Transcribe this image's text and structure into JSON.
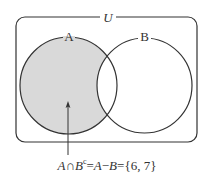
{
  "diagram": {
    "type": "venn",
    "universe": {
      "label": "U"
    },
    "sets": [
      {
        "label": "A",
        "shaded": true
      },
      {
        "label": "B",
        "shaded": false
      }
    ],
    "shaded_region": "A only (A minus B)",
    "colors": {
      "stroke": "#333333",
      "shade": "#d9d9d9",
      "background": "#ffffff"
    }
  },
  "annotation": {
    "set_a": "A",
    "cap": "∩",
    "set_b": "B",
    "complement_sup": "c",
    "eq1": "=",
    "a2": "A",
    "minus": "−",
    "b2": "B",
    "eq2": "=",
    "result": "{6, 7}"
  }
}
